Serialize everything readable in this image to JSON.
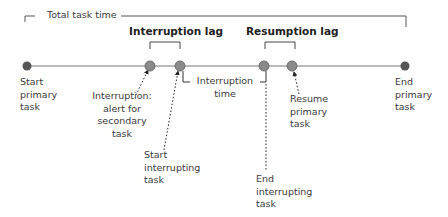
{
  "diagram": {
    "total_label": "Total task time",
    "interruption_lag_label": "Interruption lag",
    "resumption_lag_label": "Resumption lag",
    "interruption_time_label": [
      "Interruption",
      "time"
    ],
    "events": [
      {
        "id": "start-primary",
        "lines": [
          "Start",
          "primary",
          "task"
        ]
      },
      {
        "id": "interruption-alert",
        "lines": [
          "Interruption:",
          "alert for",
          "secondary",
          "task"
        ]
      },
      {
        "id": "start-interrupting",
        "lines": [
          "Start",
          "interrupting",
          "task"
        ]
      },
      {
        "id": "end-interrupting",
        "lines": [
          "End",
          "interrupting",
          "task"
        ]
      },
      {
        "id": "resume-primary",
        "lines": [
          "Resume",
          "primary",
          "task"
        ]
      },
      {
        "id": "end-primary",
        "lines": [
          "End",
          "primary",
          "task"
        ]
      }
    ],
    "colors": {
      "line": "#777777",
      "endpoint": "#555555",
      "midpoint": "#8a8a8a"
    }
  }
}
